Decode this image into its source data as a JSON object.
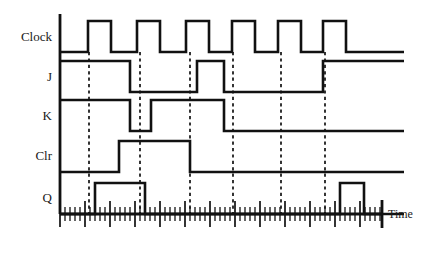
{
  "figure": {
    "kind": "jk-flip-flop-timing-diagram",
    "background_color": "#ffffff",
    "line_color": "#111111",
    "text_color": "#1a1a1a"
  },
  "axis": {
    "time_label": "Time",
    "origin_x": 60,
    "axis_top_y": 14,
    "axis_baseline_y": 214,
    "axis_end_x": 382,
    "tick_minor_spacing": 5,
    "tick_major_every": 5,
    "tick_minor_length": 7,
    "tick_major_length": 13,
    "vertical_axis_x": 60
  },
  "signals": [
    {
      "name": "Clock",
      "label": "Clock",
      "label_x": 52,
      "label_y": 41,
      "low_y": 52,
      "high_y": 21,
      "start_x": 60,
      "end_x": 404,
      "transitions": [
        [
          88,
          1
        ],
        [
          111,
          0
        ],
        [
          137,
          1
        ],
        [
          160,
          0
        ],
        [
          186,
          1
        ],
        [
          209,
          0
        ],
        [
          232,
          1
        ],
        [
          255,
          0
        ],
        [
          278,
          1
        ],
        [
          301,
          0
        ],
        [
          323,
          1
        ],
        [
          346,
          0
        ]
      ]
    },
    {
      "name": "J",
      "label": "J",
      "label_x": 52,
      "label_y": 81,
      "low_y": 92,
      "high_y": 61,
      "start_x": 60,
      "end_x": 404,
      "initial": 1,
      "transitions": [
        [
          130,
          0
        ],
        [
          197,
          1
        ],
        [
          224,
          0
        ],
        [
          323,
          1
        ]
      ]
    },
    {
      "name": "K",
      "label": "K",
      "label_x": 52,
      "label_y": 120,
      "low_y": 131,
      "high_y": 100,
      "start_x": 60,
      "end_x": 404,
      "initial": 1,
      "transitions": [
        [
          130,
          0
        ],
        [
          151,
          1
        ],
        [
          224,
          0
        ]
      ]
    },
    {
      "name": "Clr",
      "label": "Clr",
      "label_x": 52,
      "label_y": 160,
      "low_y": 172,
      "high_y": 141,
      "start_x": 60,
      "end_x": 404,
      "initial": 0,
      "transitions": [
        [
          119,
          1
        ],
        [
          190,
          0
        ]
      ]
    },
    {
      "name": "Q",
      "label": "Q",
      "label_x": 52,
      "label_y": 202,
      "low_y": 214,
      "high_y": 183,
      "start_x": 60,
      "end_x": 404,
      "initial": 0,
      "transitions": [
        [
          95,
          1
        ],
        [
          145,
          0
        ],
        [
          340,
          1
        ],
        [
          364,
          0
        ]
      ]
    }
  ],
  "edge_markers": {
    "x_positions": [
      89,
      140,
      190,
      233,
      281,
      325
    ],
    "top_y": 52,
    "bottom_y": 214,
    "style": "dashed"
  }
}
